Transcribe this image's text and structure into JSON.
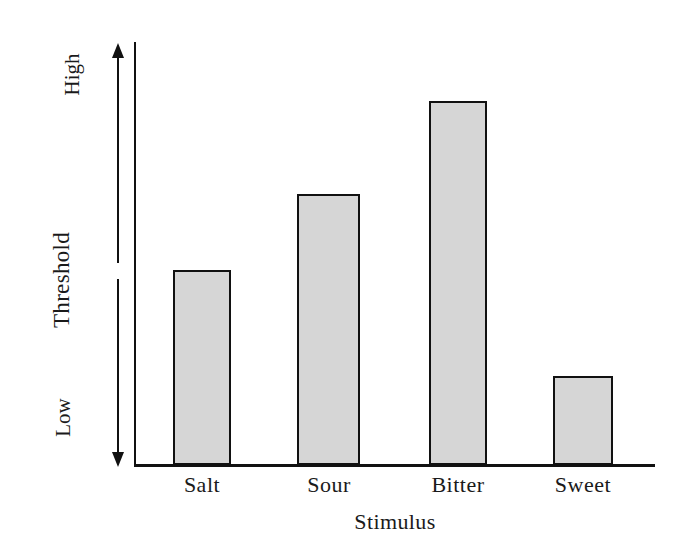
{
  "chart_data": {
    "type": "bar",
    "title": "",
    "categories": [
      "Salt",
      "Sour",
      "Bitter",
      "Sweet"
    ],
    "values": [
      0.46,
      0.64,
      0.86,
      0.21
    ],
    "xlabel": "Stimulus",
    "ylabel": "Threshold",
    "ylim": [
      0,
      1
    ],
    "y_axis_endpoint_labels": {
      "high": "High",
      "low": "Low"
    },
    "grid": false,
    "legend": null,
    "y_tick_labels": [],
    "annotations": [],
    "bar_fill_color": "#d6d6d6",
    "bar_edge_color": "#111111",
    "axis_color": "#111111",
    "background_color": "#ffffff",
    "series": [
      {
        "name": "Threshold",
        "values": [
          0.46,
          0.64,
          0.86,
          0.21
        ]
      }
    ]
  },
  "axes": {
    "y_label": "Threshold",
    "y_high_label": "High",
    "y_low_label": "Low",
    "x_label": "Stimulus"
  },
  "bars": [
    {
      "label": "Salt",
      "value": 0.46
    },
    {
      "label": "Sour",
      "value": 0.64
    },
    {
      "label": "Bitter",
      "value": 0.86
    },
    {
      "label": "Sweet",
      "value": 0.21
    }
  ]
}
